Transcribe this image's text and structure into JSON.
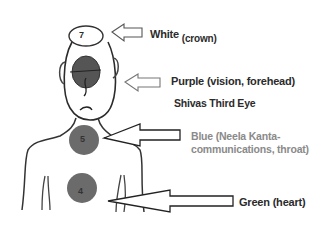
{
  "diagram": {
    "type": "chakra-body-diagram",
    "chakras": [
      {
        "number": "7",
        "name": "crown",
        "color_label": "White",
        "detail": "(crown)",
        "fill": "#ffffff"
      },
      {
        "number": "6",
        "name": "third-eye",
        "color_label": "Purple (vision, forehead)",
        "detail": "Shivas Third Eye",
        "fill": "#5a5a5a"
      },
      {
        "number": "5",
        "name": "throat",
        "color_label": "Blue",
        "detail": "(Neela Kanta-communications, throat)",
        "fill": "#6b6b6b"
      },
      {
        "number": "4",
        "name": "heart",
        "color_label": "Green (heart)",
        "detail": "",
        "fill": "#6b6b6b"
      }
    ]
  },
  "labels": {
    "white": "White",
    "white_sub": "(crown)",
    "purple": "Purple (vision, forehead)",
    "third_eye": "Shivas Third Eye",
    "blue": "Blue  (Neela Kanta-communications, throat)",
    "green": "Green (heart)"
  },
  "numbers": {
    "crown": "7",
    "throat": "5",
    "heart": "4"
  },
  "colors": {
    "line": "#2b2b2b",
    "blue_text": "#8a8a8a",
    "circle": "#6b6b6b",
    "eye": "#555555"
  }
}
